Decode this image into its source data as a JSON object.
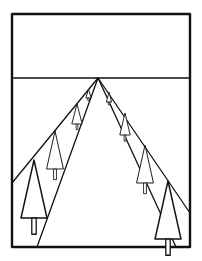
{
  "diagram": {
    "colors": {
      "ink": "#111111",
      "paper": "#ffffff"
    },
    "elements": {
      "frame": "picture frame",
      "horizon": "horizon line",
      "vanishing_point": "single vanishing point on horizon",
      "road_edges": [
        "left road edge",
        "right road edge"
      ],
      "tree_top_guides": [
        "left treetop guide line",
        "right treetop guide line"
      ]
    },
    "trees": {
      "left_row_count": 4,
      "right_row_count": 4
    }
  }
}
